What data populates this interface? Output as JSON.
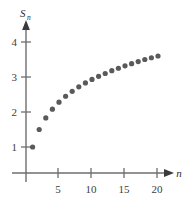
{
  "chart_data": {
    "type": "scatter",
    "title": "",
    "subtitle": "",
    "xlabel": "n",
    "ylabel": "S_n",
    "ylabel_base": "S",
    "ylabel_sub": "n",
    "xlim": [
      0,
      22
    ],
    "ylim": [
      0,
      4.6
    ],
    "xticks": [
      5,
      10,
      15,
      20
    ],
    "xtick_labels": [
      "5",
      "10",
      "15",
      "20"
    ],
    "yticks": [
      1,
      2,
      3,
      4
    ],
    "ytick_labels": [
      "1",
      "2",
      "3",
      "4"
    ],
    "grid": false,
    "legend": null,
    "annotations": [],
    "series": [
      {
        "name": "S_n",
        "marker": "circle",
        "color": "#5a5a5a",
        "x": [
          1,
          2,
          3,
          4,
          5,
          6,
          7,
          8,
          9,
          10,
          11,
          12,
          13,
          14,
          15,
          16,
          17,
          18,
          19,
          20
        ],
        "y": [
          1.0,
          1.5,
          1.83,
          2.08,
          2.28,
          2.45,
          2.59,
          2.72,
          2.83,
          2.93,
          3.02,
          3.1,
          3.18,
          3.25,
          3.32,
          3.38,
          3.44,
          3.5,
          3.55,
          3.6
        ]
      }
    ]
  },
  "style": {
    "axis_color": "#6e6e6e",
    "marker_color": "#5a5a5a",
    "text_color": "#3d3d3d",
    "background": "#ffffff"
  }
}
